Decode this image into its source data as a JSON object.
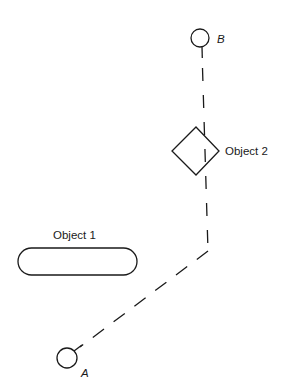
{
  "diagram": {
    "type": "path-planning",
    "stroke_color": "#1a1a1a",
    "background": "#ffffff",
    "nodes": {
      "start": {
        "label": "A",
        "shape": "circle",
        "center": [
          67,
          358
        ],
        "radius": 10
      },
      "goal": {
        "label": "B",
        "shape": "circle",
        "center": [
          200,
          38
        ],
        "radius": 9
      }
    },
    "obstacles": [
      {
        "id": "object-1",
        "label": "Object 1",
        "shape": "rounded-rectangle",
        "bounds": {
          "x": 18,
          "y": 248,
          "width": 119,
          "height": 27
        }
      },
      {
        "id": "object-2",
        "label": "Object 2",
        "shape": "diamond",
        "points": [
          [
            196,
            127
          ],
          [
            219,
            151
          ],
          [
            196,
            175
          ],
          [
            172,
            151
          ]
        ]
      }
    ],
    "path": {
      "style": "dashed",
      "waypoints": [
        [
          202,
          48
        ],
        [
          208,
          251
        ],
        [
          76,
          350
        ]
      ]
    }
  }
}
